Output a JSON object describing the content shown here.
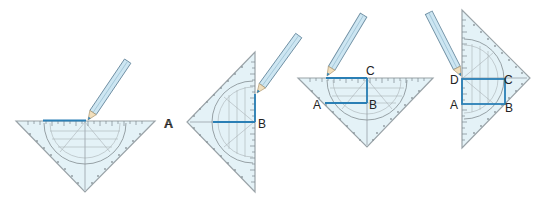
{
  "colors": {
    "triangle_fill": "#e4f2f7",
    "triangle_edge": "#9aa3a8",
    "scale_marks": "#7d878c",
    "construction_line": "#2a7fb5",
    "pencil_body": "#cde6f2",
    "pencil_edge": "#6f8fa3",
    "pencil_tip": "#f1dfbd",
    "label": "#222222"
  },
  "panels": [
    {
      "step": 1,
      "labels": [
        {
          "text": "A",
          "x": 168,
          "y": 128
        }
      ]
    },
    {
      "step": 2,
      "labels": [
        {
          "text": "A",
          "x": 165,
          "y": 128
        },
        {
          "text": "B",
          "x": 257,
          "y": 128
        }
      ]
    },
    {
      "step": 3,
      "labels": [
        {
          "text": "C",
          "x": 366,
          "y": 75
        },
        {
          "text": "A",
          "x": 313,
          "y": 108
        },
        {
          "text": "B",
          "x": 369,
          "y": 108
        }
      ]
    },
    {
      "step": 4,
      "labels": [
        {
          "text": "D",
          "x": 450,
          "y": 84
        },
        {
          "text": "C",
          "x": 505,
          "y": 84
        },
        {
          "text": "A",
          "x": 450,
          "y": 109
        },
        {
          "text": "B",
          "x": 506,
          "y": 112
        }
      ]
    }
  ],
  "p1": {
    "A": "A"
  },
  "p2": {
    "A": "A",
    "B": "B"
  },
  "p3": {
    "A": "A",
    "B": "B",
    "C": "C"
  },
  "p4": {
    "A": "A",
    "B": "B",
    "C": "C",
    "D": "D"
  }
}
